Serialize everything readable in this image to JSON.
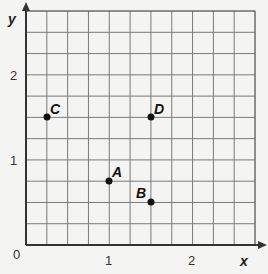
{
  "chart_data": {
    "type": "scatter",
    "title": "",
    "xlabel": "x",
    "ylabel": "y",
    "xlim": [
      0,
      2.75
    ],
    "ylim": [
      0,
      2.75
    ],
    "grid": true,
    "grid_step": 0.25,
    "x_ticks": [
      {
        "value": 0,
        "label": "0"
      },
      {
        "value": 1,
        "label": "1"
      },
      {
        "value": 2,
        "label": "2"
      }
    ],
    "y_ticks": [
      {
        "value": 1,
        "label": "1"
      },
      {
        "value": 2,
        "label": "2"
      }
    ],
    "points": [
      {
        "label": "A",
        "x": 1.0,
        "y": 0.75
      },
      {
        "label": "B",
        "x": 1.5,
        "y": 0.5
      },
      {
        "label": "C",
        "x": 0.25,
        "y": 1.5
      },
      {
        "label": "D",
        "x": 1.5,
        "y": 1.5
      }
    ]
  },
  "labels": {
    "origin": "0",
    "x_axis": "x",
    "y_axis": "y",
    "x_tick_1": "1",
    "x_tick_2": "2",
    "y_tick_1": "1",
    "y_tick_2": "2",
    "point_a": "A",
    "point_b": "B",
    "point_c": "C",
    "point_d": "D"
  },
  "colors": {
    "grid": "#7a7a7a",
    "axis": "#333333",
    "point": "#111111",
    "background": "#f4f4f2"
  }
}
